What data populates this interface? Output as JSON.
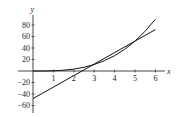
{
  "chart_data": {
    "type": "line",
    "title": "",
    "xlabel": "x",
    "ylabel": "y",
    "xlim": [
      0,
      6.5
    ],
    "ylim": [
      -70,
      95
    ],
    "x_ticks": [
      1,
      2,
      3,
      4,
      5,
      6
    ],
    "y_ticks": [
      80,
      60,
      40,
      20,
      -20,
      -40,
      -60
    ],
    "grid": false,
    "legend": null,
    "series": [
      {
        "name": "curve",
        "x": [
          0,
          0.5,
          1,
          1.5,
          2,
          2.5,
          3,
          3.5,
          4,
          4.5,
          5,
          5.5,
          6
        ],
        "values": [
          0,
          0.05,
          0.42,
          1.41,
          3.33,
          6.51,
          11.25,
          17.86,
          26.67,
          37.97,
          52.08,
          69.32,
          90
        ]
      },
      {
        "name": "tangent-line-at-x-4",
        "x": [
          0,
          6
        ],
        "values": [
          -48,
          72
        ]
      }
    ]
  },
  "labels": {
    "x_axis": "x",
    "y_axis": "y",
    "x_tick_labels": [
      "1",
      "2",
      "3",
      "4",
      "5",
      "6"
    ],
    "y_tick_labels": [
      "80",
      "60",
      "40",
      "20",
      "−20",
      "−40",
      "−60"
    ]
  }
}
